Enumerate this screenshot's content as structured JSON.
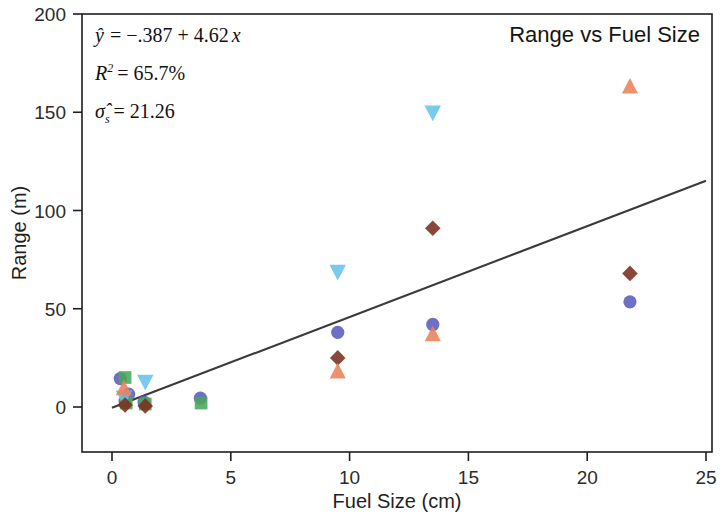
{
  "chart_data": {
    "type": "scatter",
    "title": "Range vs Fuel Size",
    "xlabel": "Fuel Size (cm)",
    "ylabel": "Range (m)",
    "xlim": [
      0,
      25
    ],
    "ylim": [
      0,
      200
    ],
    "xticks": [
      "0",
      "5",
      "10",
      "15",
      "20",
      "25"
    ],
    "xtick_values": [
      0,
      5,
      10,
      15,
      20,
      25
    ],
    "yticks": [
      "0",
      "50",
      "100",
      "150",
      "200"
    ],
    "ytick_values": [
      0,
      50,
      100,
      150,
      200
    ],
    "grid": false,
    "legend": "none",
    "annotations": [
      {
        "id": "equation",
        "text": "ŷ = −.387 + 4.62x"
      },
      {
        "id": "r-squared",
        "text": "R² = 65.7%"
      },
      {
        "id": "sigma",
        "text": "σ̂ₛ = 21.26"
      }
    ],
    "fit_line": {
      "type": "linear",
      "intercept": -0.387,
      "slope": 4.62,
      "r_squared_percent": 65.7,
      "sigma_hat": 21.26,
      "color": "#3a3a3a",
      "x_start": 0,
      "x_end": 25
    },
    "series": [
      {
        "name": "circle",
        "marker": "circle",
        "color": "#5b5bbf",
        "points": [
          {
            "x": 0.35,
            "y": 14.5
          },
          {
            "x": 0.55,
            "y": 3.0
          },
          {
            "x": 0.7,
            "y": 6.5
          },
          {
            "x": 1.35,
            "y": 2.5
          },
          {
            "x": 3.72,
            "y": 4.5
          },
          {
            "x": 9.5,
            "y": 38.0
          },
          {
            "x": 13.5,
            "y": 42.0
          },
          {
            "x": 21.8,
            "y": 53.5
          }
        ]
      },
      {
        "name": "square",
        "marker": "square",
        "color": "#49a85a",
        "points": [
          {
            "x": 0.55,
            "y": 15.0
          },
          {
            "x": 0.6,
            "y": 2.0
          },
          {
            "x": 1.4,
            "y": 1.5
          },
          {
            "x": 3.75,
            "y": 2.0
          }
        ]
      },
      {
        "name": "down-triangle-cyan",
        "marker": "triangle-down",
        "color": "#67c3e8",
        "points": [
          {
            "x": 0.5,
            "y": 5.0
          },
          {
            "x": 1.4,
            "y": 13.0
          },
          {
            "x": 9.5,
            "y": 69.0
          },
          {
            "x": 13.5,
            "y": 150.0
          }
        ]
      },
      {
        "name": "diamond",
        "marker": "diamond",
        "color": "#7b2d1e",
        "points": [
          {
            "x": 0.55,
            "y": 1.0
          },
          {
            "x": 1.4,
            "y": 0.5
          },
          {
            "x": 9.5,
            "y": 25.0
          },
          {
            "x": 13.5,
            "y": 91.0
          },
          {
            "x": 21.8,
            "y": 68.0
          }
        ]
      },
      {
        "name": "up-triangle-orange",
        "marker": "triangle-up",
        "color": "#e8825c",
        "points": [
          {
            "x": 0.5,
            "y": 9.5
          },
          {
            "x": 9.5,
            "y": 18.0
          },
          {
            "x": 13.5,
            "y": 37.0
          },
          {
            "x": 21.8,
            "y": 163.0
          }
        ]
      }
    ]
  },
  "colors": {
    "axis": "#1f1f1f",
    "fit_line": "#3a3a3a",
    "background": "#ffffff"
  }
}
